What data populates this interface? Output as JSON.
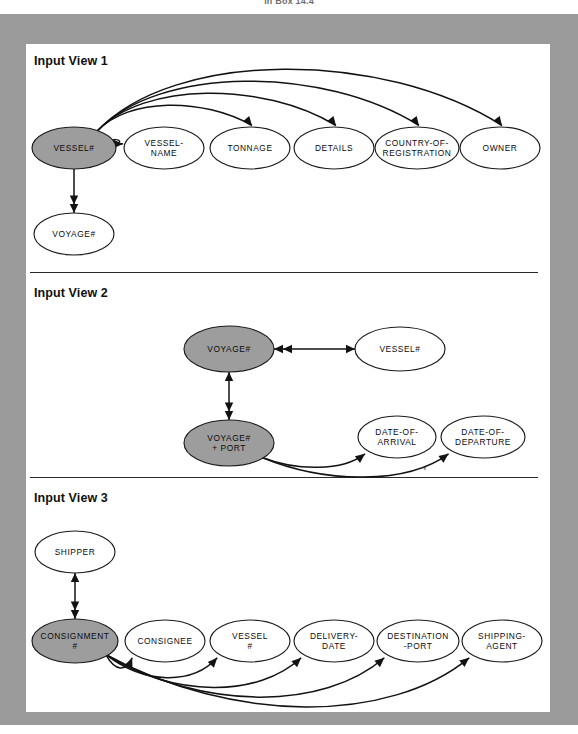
{
  "page": {
    "top_caption": "in Box 14.4",
    "frame_color": "#9b9b9b",
    "sheet_color": "#ffffff",
    "shaded_node_color": "#9d9d9d",
    "line_color": "#121212"
  },
  "sections": [
    {
      "id": "view1",
      "title": "Input View 1",
      "nodes": [
        {
          "id": "v1-vessel-no",
          "labels": [
            "VESSEL#"
          ],
          "shaded": true,
          "cx": 48,
          "cy": 104,
          "rx": 42,
          "ry": 21
        },
        {
          "id": "v1-vessel-name",
          "labels": [
            "VESSEL-",
            "NAME"
          ],
          "shaded": false,
          "cx": 138,
          "cy": 104,
          "rx": 40,
          "ry": 21
        },
        {
          "id": "v1-tonnage",
          "labels": [
            "TONNAGE"
          ],
          "shaded": false,
          "cx": 224,
          "cy": 104,
          "rx": 40,
          "ry": 21
        },
        {
          "id": "v1-details",
          "labels": [
            "DETAILS"
          ],
          "shaded": false,
          "cx": 308,
          "cy": 104,
          "rx": 40,
          "ry": 21
        },
        {
          "id": "v1-country",
          "labels": [
            "COUNTRY-OF-",
            "REGISTRATION"
          ],
          "shaded": false,
          "cx": 391,
          "cy": 104,
          "rx": 42,
          "ry": 21
        },
        {
          "id": "v1-owner",
          "labels": [
            "OWNER"
          ],
          "shaded": false,
          "cx": 474,
          "cy": 104,
          "rx": 40,
          "ry": 21
        },
        {
          "id": "v1-voyage-no",
          "labels": [
            "VOYAGE#"
          ],
          "shaded": false,
          "cx": 48,
          "cy": 190,
          "rx": 40,
          "ry": 21
        }
      ],
      "edges": [
        {
          "from": "v1-vessel-no",
          "to": "v1-vessel-name",
          "kind": "arc-single"
        },
        {
          "from": "v1-vessel-no",
          "to": "v1-tonnage",
          "kind": "arc-single"
        },
        {
          "from": "v1-vessel-no",
          "to": "v1-details",
          "kind": "arc-single"
        },
        {
          "from": "v1-vessel-no",
          "to": "v1-country",
          "kind": "arc-single"
        },
        {
          "from": "v1-vessel-no",
          "to": "v1-owner",
          "kind": "arc-single"
        },
        {
          "from": "v1-vessel-no",
          "to": "v1-voyage-no",
          "kind": "vertical-double"
        }
      ]
    },
    {
      "id": "view2",
      "title": "Input View 2",
      "nodes": [
        {
          "id": "v2-voyage-no",
          "labels": [
            "VOYAGE#"
          ],
          "shaded": true,
          "cx": 203,
          "cy": 305,
          "rx": 45,
          "ry": 23
        },
        {
          "id": "v2-vessel-no",
          "labels": [
            "VESSEL#"
          ],
          "shaded": false,
          "cx": 374,
          "cy": 305,
          "rx": 45,
          "ry": 22
        },
        {
          "id": "v2-voyage-port",
          "labels": [
            "VOYAGE#",
            "+ PORT"
          ],
          "shaded": true,
          "cx": 203,
          "cy": 399,
          "rx": 45,
          "ry": 23
        },
        {
          "id": "v2-date-arrival",
          "labels": [
            "DATE-OF-",
            "ARRIVAL"
          ],
          "shaded": false,
          "cx": 371,
          "cy": 393,
          "rx": 39,
          "ry": 21
        },
        {
          "id": "v2-date-departure",
          "labels": [
            "DATE-OF-",
            "DEPARTURE"
          ],
          "shaded": false,
          "cx": 457,
          "cy": 393,
          "rx": 42,
          "ry": 21
        }
      ],
      "edges": [
        {
          "from": "v2-voyage-no",
          "to": "v2-vessel-no",
          "kind": "bidirectional"
        },
        {
          "from": "v2-voyage-no",
          "to": "v2-voyage-port",
          "kind": "vertical-bidirectional"
        },
        {
          "from": "v2-voyage-port",
          "to": "v2-date-arrival",
          "kind": "arc-single"
        },
        {
          "from": "v2-voyage-port",
          "to": "v2-date-departure",
          "kind": "arc-single"
        }
      ]
    },
    {
      "id": "view3",
      "title": "Input View 3",
      "nodes": [
        {
          "id": "v3-shipper",
          "labels": [
            "SHIPPER"
          ],
          "shaded": false,
          "cx": 49,
          "cy": 508,
          "rx": 40,
          "ry": 21
        },
        {
          "id": "v3-consignment",
          "labels": [
            "CONSIGNMENT",
            "#"
          ],
          "shaded": true,
          "cx": 49,
          "cy": 597,
          "rx": 43,
          "ry": 22
        },
        {
          "id": "v3-consignee",
          "labels": [
            "CONSIGNEE"
          ],
          "shaded": false,
          "cx": 139,
          "cy": 597,
          "rx": 40,
          "ry": 21
        },
        {
          "id": "v3-vessel-no",
          "labels": [
            "VESSEL",
            "#"
          ],
          "shaded": false,
          "cx": 224,
          "cy": 597,
          "rx": 40,
          "ry": 21
        },
        {
          "id": "v3-delivery-date",
          "labels": [
            "DELIVERY-",
            "DATE"
          ],
          "shaded": false,
          "cx": 308,
          "cy": 597,
          "rx": 40,
          "ry": 21
        },
        {
          "id": "v3-destination-port",
          "labels": [
            "DESTINATION",
            "-PORT"
          ],
          "shaded": false,
          "cx": 392,
          "cy": 597,
          "rx": 41,
          "ry": 21
        },
        {
          "id": "v3-shipping-agent",
          "labels": [
            "SHIPPING-",
            "AGENT"
          ],
          "shaded": false,
          "cx": 476,
          "cy": 597,
          "rx": 40,
          "ry": 21
        }
      ],
      "edges": [
        {
          "from": "v3-consignment",
          "to": "v3-shipper",
          "kind": "vertical-bidirectional"
        },
        {
          "from": "v3-consignment",
          "to": "v3-consignee",
          "kind": "arc-single"
        },
        {
          "from": "v3-consignment",
          "to": "v3-vessel-no",
          "kind": "arc-single"
        },
        {
          "from": "v3-consignment",
          "to": "v3-delivery-date",
          "kind": "arc-single"
        },
        {
          "from": "v3-consignment",
          "to": "v3-destination-port",
          "kind": "arc-single"
        },
        {
          "from": "v3-consignment",
          "to": "v3-shipping-agent",
          "kind": "arc-single"
        }
      ]
    }
  ],
  "section_titles": {
    "view1": "Input View 1",
    "view2": "Input View 2",
    "view3": "Input View 3"
  }
}
